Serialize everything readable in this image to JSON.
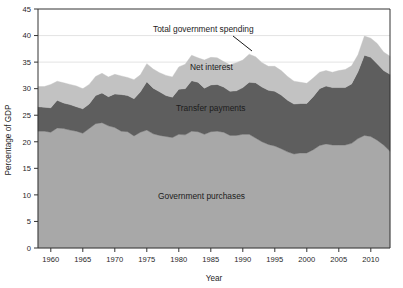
{
  "chart_data": {
    "type": "area",
    "stacked": true,
    "title": "",
    "xlabel": "Year",
    "ylabel": "Percentage of GDP",
    "xlim": [
      1958,
      2013
    ],
    "ylim": [
      0,
      45
    ],
    "ytick_step": 5,
    "yticks": [
      0,
      5,
      10,
      15,
      20,
      25,
      30,
      35,
      40,
      45
    ],
    "xticks": [
      1960,
      1965,
      1970,
      1975,
      1980,
      1985,
      1990,
      1995,
      2000,
      2005,
      2010
    ],
    "grid": "horizontal-faint",
    "legend": "inline-annotations",
    "x": [
      1958,
      1959,
      1960,
      1961,
      1962,
      1963,
      1964,
      1965,
      1966,
      1967,
      1968,
      1969,
      1970,
      1971,
      1972,
      1973,
      1974,
      1975,
      1976,
      1977,
      1978,
      1979,
      1980,
      1981,
      1982,
      1983,
      1984,
      1985,
      1986,
      1987,
      1988,
      1989,
      1990,
      1991,
      1992,
      1993,
      1994,
      1995,
      1996,
      1997,
      1998,
      1999,
      2000,
      2001,
      2002,
      2003,
      2004,
      2005,
      2006,
      2007,
      2008,
      2009,
      2010,
      2011,
      2012,
      2013
    ],
    "series": [
      {
        "name": "Government purchases",
        "color": "#a8a8a8",
        "values": [
          22.0,
          22.0,
          21.8,
          22.6,
          22.5,
          22.2,
          22.0,
          21.6,
          22.5,
          23.4,
          23.6,
          23.0,
          22.7,
          22.0,
          21.9,
          21.1,
          21.8,
          22.2,
          21.5,
          21.2,
          21.0,
          20.8,
          21.4,
          21.3,
          22.0,
          21.9,
          21.4,
          21.9,
          22.0,
          21.8,
          21.2,
          21.2,
          21.4,
          21.4,
          20.7,
          20.0,
          19.5,
          19.2,
          18.7,
          18.1,
          17.7,
          17.9,
          17.9,
          18.5,
          19.3,
          19.6,
          19.4,
          19.4,
          19.4,
          19.7,
          20.6,
          21.2,
          21.0,
          20.3,
          19.4,
          18.2
        ]
      },
      {
        "name": "Transfer payments",
        "color": "#5e5e5e",
        "values": [
          4.6,
          4.5,
          4.6,
          5.2,
          4.8,
          4.8,
          4.6,
          4.6,
          4.6,
          5.3,
          5.6,
          5.5,
          6.3,
          6.9,
          6.8,
          7.0,
          7.6,
          9.1,
          8.6,
          8.2,
          7.7,
          7.6,
          8.5,
          8.7,
          9.5,
          9.3,
          8.7,
          8.8,
          8.8,
          8.5,
          8.3,
          8.4,
          8.8,
          9.8,
          10.4,
          10.3,
          10.2,
          10.3,
          10.1,
          9.7,
          9.4,
          9.3,
          9.3,
          10.0,
          10.7,
          10.9,
          10.8,
          10.8,
          10.8,
          11.2,
          12.6,
          15.1,
          14.9,
          14.4,
          14.0,
          14.5
        ]
      },
      {
        "name": "Net interest",
        "color": "#c2c2c2",
        "values": [
          3.8,
          3.9,
          4.4,
          3.6,
          3.8,
          3.8,
          3.9,
          3.8,
          3.7,
          3.6,
          3.7,
          3.7,
          3.7,
          3.5,
          3.4,
          3.6,
          3.2,
          3.4,
          3.6,
          3.6,
          3.8,
          3.8,
          4.2,
          4.6,
          4.8,
          4.6,
          5.3,
          5.2,
          5.0,
          4.8,
          5.0,
          5.3,
          5.2,
          5.3,
          4.9,
          4.6,
          4.5,
          4.7,
          4.6,
          4.5,
          4.3,
          4.0,
          3.8,
          3.5,
          3.1,
          2.9,
          2.9,
          3.2,
          3.4,
          3.4,
          3.2,
          3.6,
          3.6,
          3.8,
          3.5,
          3.4
        ]
      }
    ],
    "annotations": [
      {
        "text": "Total government spending",
        "x_px": 153,
        "y_px": 32,
        "leader": {
          "x1": 233,
          "y1": 36,
          "x2": 252,
          "y2": 51
        }
      },
      {
        "text": "Net interest",
        "x_px": 190,
        "y_px": 70
      },
      {
        "text": "Transfer payments",
        "x_px": 176,
        "y_px": 111
      },
      {
        "text": "Government purchases",
        "x_px": 158,
        "y_px": 199
      }
    ]
  },
  "axes": {
    "y_title": "Percentage of GDP",
    "x_title": "Year",
    "y_tick_labels": [
      "0",
      "5",
      "10",
      "15",
      "20",
      "25",
      "30",
      "35",
      "40",
      "45"
    ],
    "x_tick_labels": [
      "1960",
      "1965",
      "1970",
      "1975",
      "1980",
      "1985",
      "1990",
      "1995",
      "2000",
      "2005",
      "2010"
    ]
  }
}
